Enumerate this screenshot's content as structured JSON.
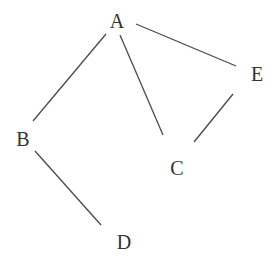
{
  "diagram": {
    "type": "undirected-graph",
    "background": "#ffffff",
    "edge_color": "#4a4a4a",
    "label_color": "#333333",
    "nodes": [
      {
        "id": "A",
        "label": "A",
        "x": 117,
        "y": 21
      },
      {
        "id": "B",
        "label": "B",
        "x": 23,
        "y": 139
      },
      {
        "id": "C",
        "label": "C",
        "x": 177,
        "y": 168
      },
      {
        "id": "D",
        "label": "D",
        "x": 124,
        "y": 242
      },
      {
        "id": "E",
        "label": "E",
        "x": 257,
        "y": 74
      }
    ],
    "edges": [
      {
        "from": "A",
        "to": "B",
        "x1": 106,
        "y1": 34,
        "x2": 33,
        "y2": 121
      },
      {
        "from": "A",
        "to": "C",
        "x1": 120,
        "y1": 35,
        "x2": 163,
        "y2": 135
      },
      {
        "from": "A",
        "to": "E",
        "x1": 136,
        "y1": 24,
        "x2": 236,
        "y2": 66
      },
      {
        "from": "E",
        "to": "C",
        "x1": 233,
        "y1": 94,
        "x2": 194,
        "y2": 142
      },
      {
        "from": "B",
        "to": "D",
        "x1": 35,
        "y1": 151,
        "x2": 101,
        "y2": 225
      }
    ]
  }
}
